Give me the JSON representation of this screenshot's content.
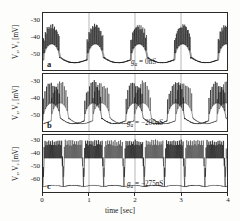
{
  "figure": {
    "xlabel": "time [sec]",
    "xticks": [
      "0",
      "1",
      "2",
      "3",
      "4"
    ],
    "ylabel": "V₁, V₂ [mV]",
    "panels": [
      {
        "letter": "a",
        "condition_symbol": "g",
        "condition_sub": "a",
        "condition_value": " = 0nS",
        "yticks": [
          "-30",
          "-40",
          "-50"
        ]
      },
      {
        "letter": "b",
        "condition_symbol": "g",
        "condition_sub": "a",
        "condition_value": " = −200nS",
        "yticks": [
          "-30",
          "-40",
          "-50"
        ]
      },
      {
        "letter": "c",
        "condition_symbol": "g",
        "condition_sub": "a",
        "condition_value": " = −275nS",
        "yticks": [
          "-30",
          "-40",
          "-50",
          "-60"
        ]
      }
    ]
  },
  "chart_data": {
    "type": "line",
    "title": "",
    "xlabel": "time [sec]",
    "ylabel": "V1, V2 [mV]",
    "xlim": [
      0,
      4
    ],
    "grid": false,
    "legend": "none",
    "panels": [
      {
        "id": "a",
        "annotation": "g_a = 0nS",
        "ylim": [
          -55,
          -27
        ],
        "yticks": [
          -30,
          -40,
          -50
        ],
        "description": "Two nearly synchronous bursting traces V1 and V2; four burst episodes of fast spikes riding on slow depolarizing plateaus, separated by hyperpolarized troughs near -52 mV; spike peaks reach about -33 mV.",
        "burst_period_sec": 0.95,
        "n_bursts": 4,
        "spikes_per_burst": 9,
        "baseline_mV": -50,
        "spike_peak_mV": -33,
        "series": [
          {
            "name": "V1",
            "phase_offset_sec": 0.0
          },
          {
            "name": "V2",
            "phase_offset_sec": 0.02
          }
        ]
      },
      {
        "id": "b",
        "annotation": "g_a = -200nS",
        "ylim": [
          -55,
          -27
        ],
        "yticks": [
          -30,
          -40,
          -50
        ],
        "description": "Partially desynchronized bursting; V1 fires dense spike trains while V2 shows reduced plateau excursions, traces separate in the interburst intervals; irregular burst boundaries.",
        "burst_period_sec": 0.9,
        "n_bursts": 4,
        "spikes_per_burst": 11,
        "baseline_mV": -50,
        "spike_peak_mV": -31,
        "series": [
          {
            "name": "V1",
            "phase_offset_sec": 0.0
          },
          {
            "name": "V2",
            "phase_offset_sec": 0.18
          }
        ]
      },
      {
        "id": "c",
        "annotation": "g_a = -275nS",
        "ylim": [
          -64,
          -27
        ],
        "yticks": [
          -30,
          -40,
          -50,
          -60
        ],
        "description": "Robust anti-phase bursting; when V1 is in its spiking plateau V2 sits in a deep hyperpolarized trough near -60 mV and vice versa; long square-wave plateaus with dense tonic spiking.",
        "burst_period_sec": 0.88,
        "n_bursts": 5,
        "spikes_per_burst": 22,
        "baseline_mV": -60,
        "spike_peak_mV": -31,
        "series": [
          {
            "name": "V1",
            "phase_offset_sec": 0.0
          },
          {
            "name": "V2",
            "phase_offset_sec": 0.44
          }
        ]
      }
    ]
  }
}
